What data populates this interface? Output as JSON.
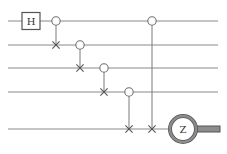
{
  "diagram": {
    "type": "quantum-circuit",
    "num_qubits": 5,
    "gates": [
      {
        "kind": "single",
        "label": "H",
        "qubit": 0,
        "step": 0
      },
      {
        "kind": "controlled-x",
        "control": 0,
        "target": 1,
        "step": 1
      },
      {
        "kind": "controlled-x",
        "control": 1,
        "target": 2,
        "step": 2
      },
      {
        "kind": "controlled-x",
        "control": 2,
        "target": 3,
        "step": 3
      },
      {
        "kind": "controlled-x",
        "control": 3,
        "target": 4,
        "step": 4
      },
      {
        "kind": "controlled-x",
        "control": 0,
        "target": 4,
        "step": 5
      },
      {
        "kind": "measure",
        "label": "Z",
        "qubit": 4,
        "step": 6
      }
    ]
  }
}
